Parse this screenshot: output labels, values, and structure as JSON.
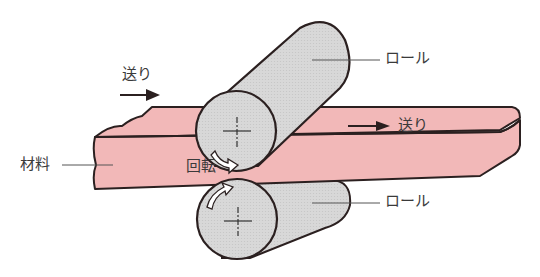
{
  "diagram": {
    "type": "rolling-process-illustration",
    "colors": {
      "material": "#f2b8b8",
      "roll": "#d6d6d6",
      "outline": "#2b2020",
      "text": "#3a3a3a",
      "leader_line": "#555555"
    },
    "labels": {
      "feed_in": "送り",
      "feed_out": "送り",
      "roll_top": "ロール",
      "roll_bottom": "ロール",
      "material": "材料",
      "rotation": "回転"
    },
    "arrows": {
      "feed_in": "right",
      "feed_out": "right",
      "top_roll_rotation": "clockwise",
      "bottom_roll_rotation": "counter-clockwise"
    }
  }
}
